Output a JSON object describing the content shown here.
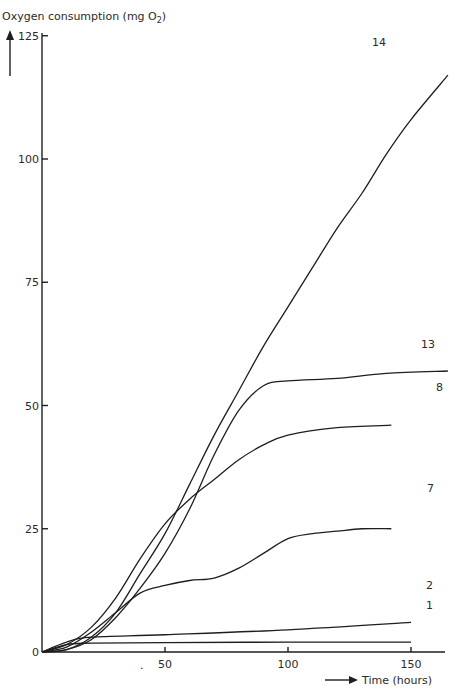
{
  "chart_data": {
    "type": "line",
    "title": "",
    "ylabel": "Oxygen consumption (mg O2)",
    "xlabel": "Time (hours)",
    "xlim": [
      0,
      165
    ],
    "ylim": [
      0,
      125
    ],
    "x_ticks": [
      "50",
      "100",
      "150"
    ],
    "y_ticks": [
      "0",
      "25",
      "50",
      "75",
      "100",
      "125"
    ],
    "grid": false,
    "legend": "curve labels at right end",
    "series": [
      {
        "name": "14",
        "x": [
          0,
          10,
          20,
          30,
          40,
          50,
          60,
          70,
          80,
          90,
          100,
          110,
          120,
          130,
          140,
          150,
          165
        ],
        "values": [
          0,
          0.5,
          3,
          8,
          16,
          24,
          34,
          44,
          53,
          62,
          70,
          78,
          86,
          93,
          101,
          108,
          117
        ]
      },
      {
        "name": "13",
        "x": [
          0,
          10,
          20,
          30,
          40,
          50,
          60,
          70,
          80,
          90,
          100,
          120,
          140,
          165
        ],
        "values": [
          0,
          0.5,
          2.5,
          7,
          13,
          20,
          29,
          40,
          49,
          54,
          55,
          55.5,
          56.5,
          57
        ]
      },
      {
        "name": "8",
        "x": [
          0,
          10,
          20,
          30,
          40,
          50,
          60,
          70,
          80,
          90,
          100,
          120,
          142
        ],
        "values": [
          0,
          1.5,
          5,
          11,
          19,
          26,
          31,
          35,
          39,
          42,
          44,
          45.5,
          46
        ]
      },
      {
        "name": "7",
        "x": [
          0,
          10,
          20,
          30,
          40,
          50,
          60,
          70,
          80,
          90,
          100,
          110,
          120,
          130,
          142
        ],
        "values": [
          0,
          1,
          4,
          8,
          12,
          13.5,
          14.5,
          15,
          17,
          20,
          23,
          24,
          24.5,
          25,
          25
        ]
      },
      {
        "name": "2",
        "x": [
          0,
          10,
          20,
          50,
          100,
          150
        ],
        "values": [
          0,
          2,
          3,
          3.5,
          4.5,
          6
        ]
      },
      {
        "name": "1",
        "x": [
          0,
          10,
          20,
          50,
          100,
          150
        ],
        "values": [
          0,
          1.5,
          1.8,
          1.9,
          2,
          2
        ]
      }
    ],
    "curve_labels": [
      {
        "text": "14",
        "x_px": 372,
        "y_px": 46
      },
      {
        "text": "13",
        "x_px": 421,
        "y_px": 348
      },
      {
        "text": "8",
        "x_px": 436,
        "y_px": 391
      },
      {
        "text": "7",
        "x_px": 427,
        "y_px": 492
      },
      {
        "text": "2",
        "x_px": 426,
        "y_px": 589
      },
      {
        "text": "1",
        "x_px": 426,
        "y_px": 609
      }
    ],
    "annotations": [
      "."
    ]
  },
  "axes": {
    "y_title": "Oxygen consumption (mg O",
    "y_title_sub": "2",
    "y_title_end": ")",
    "x_title": "Time (hours)"
  }
}
